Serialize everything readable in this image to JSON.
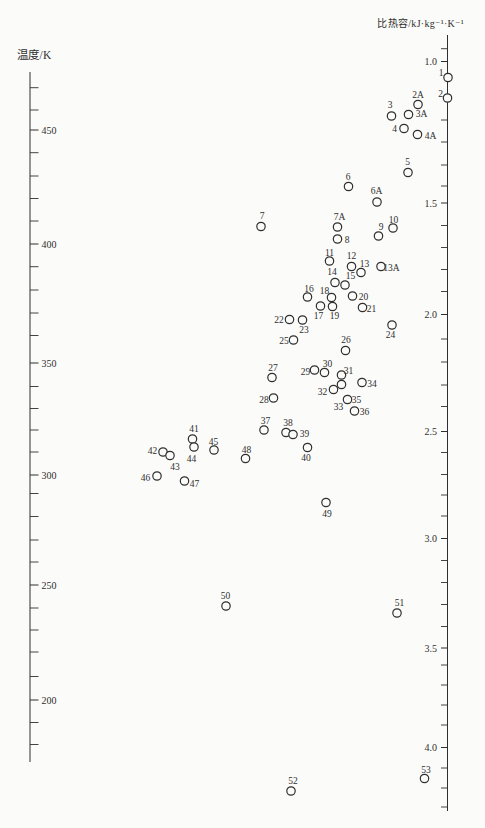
{
  "page": {
    "background": "#fbfbf9",
    "ink": "#2f2f2f"
  },
  "chart_data": {
    "type": "scatter",
    "title": "",
    "left_axis": {
      "title": "温度/K",
      "unit": "K",
      "range": [
        180,
        470
      ],
      "x_px": 30,
      "top_px": 72,
      "bottom_px": 762,
      "tick_len": 8.5,
      "majors": [
        {
          "value": "450",
          "y": 130
        },
        {
          "value": "400",
          "y": 244
        },
        {
          "value": "350",
          "y": 363
        },
        {
          "value": "300",
          "y": 475
        },
        {
          "value": "250",
          "y": 585
        },
        {
          "value": "200",
          "y": 700
        }
      ],
      "minor_y": [
        87.7,
        110,
        152.7,
        176,
        198.5,
        221,
        266.7,
        290,
        313,
        335.5,
        386.5,
        408.5,
        430,
        452,
        493.5,
        516.5,
        540,
        562,
        608,
        630,
        652,
        676.5,
        722.5,
        744.5
      ]
    },
    "right_axis": {
      "title": "比热容/kJ·kg⁻¹·K⁻¹",
      "unit": "kJ·kg⁻¹·K⁻¹",
      "range": [
        1.0,
        4.3
      ],
      "x_px": 447.5,
      "top_px": 35,
      "bottom_px": 811,
      "tick_len": 6.5,
      "majors": [
        {
          "value": "1.0",
          "y": 61.5
        },
        {
          "value": "1.5",
          "y": 203
        },
        {
          "value": "2.0",
          "y": 314.5
        },
        {
          "value": "2.5",
          "y": 431.5
        },
        {
          "value": "3.0",
          "y": 538.5
        },
        {
          "value": "3.5",
          "y": 648
        },
        {
          "value": "4.0",
          "y": 747.5
        }
      ],
      "minor_y": [
        48.7,
        120,
        142,
        165,
        186,
        225.5,
        247.5,
        269.5,
        291.5,
        339,
        362,
        385,
        406.5,
        452.5,
        474.5,
        495,
        516,
        560.5,
        582.5,
        604.5,
        626.5,
        665,
        685,
        705,
        725,
        768,
        788,
        807
      ]
    },
    "marker": {
      "radius": 4.2,
      "stroke_width": 1.2
    },
    "points": [
      {
        "label": "1",
        "cx": 448,
        "cy": 77.5,
        "lx": 441,
        "ly": 72.5
      },
      {
        "label": "2",
        "cx": 447.5,
        "cy": 98,
        "lx": 440.5,
        "ly": 93.5
      },
      {
        "label": "2A",
        "cx": 418,
        "cy": 104.5,
        "lx": 418,
        "ly": 95
      },
      {
        "label": "3",
        "cx": 391.5,
        "cy": 116,
        "lx": 390,
        "ly": 105
      },
      {
        "label": "3A",
        "cx": 408.5,
        "cy": 114.5,
        "lx": 421.5,
        "ly": 113.5
      },
      {
        "label": "4",
        "cx": 404,
        "cy": 128.5,
        "lx": 394.5,
        "ly": 128.5
      },
      {
        "label": "4A",
        "cx": 417.5,
        "cy": 134.5,
        "lx": 430.5,
        "ly": 136
      },
      {
        "label": "5",
        "cx": 408,
        "cy": 172.5,
        "lx": 407.5,
        "ly": 161.5
      },
      {
        "label": "6",
        "cx": 348.5,
        "cy": 186.5,
        "lx": 348,
        "ly": 176.5
      },
      {
        "label": "6A",
        "cx": 377,
        "cy": 202,
        "lx": 376.5,
        "ly": 191
      },
      {
        "label": "7",
        "cx": 261,
        "cy": 226.5,
        "lx": 262,
        "ly": 216
      },
      {
        "label": "7A",
        "cx": 337.5,
        "cy": 227,
        "lx": 339.5,
        "ly": 216.5
      },
      {
        "label": "8",
        "cx": 337.5,
        "cy": 239,
        "lx": 347,
        "ly": 239.5
      },
      {
        "label": "9",
        "cx": 378.5,
        "cy": 236,
        "lx": 381,
        "ly": 226.5
      },
      {
        "label": "10",
        "cx": 393,
        "cy": 228,
        "lx": 393.5,
        "ly": 219.5
      },
      {
        "label": "11",
        "cx": 329.5,
        "cy": 261,
        "lx": 329.5,
        "ly": 253
      },
      {
        "label": "12",
        "cx": 351.5,
        "cy": 266.5,
        "lx": 351.5,
        "ly": 256
      },
      {
        "label": "13",
        "cx": 361,
        "cy": 272.5,
        "lx": 364.5,
        "ly": 264
      },
      {
        "label": "13A",
        "cx": 381,
        "cy": 266.5,
        "lx": 391.5,
        "ly": 267.5
      },
      {
        "label": "14",
        "cx": 335,
        "cy": 282.5,
        "lx": 332,
        "ly": 272
      },
      {
        "label": "15",
        "cx": 345,
        "cy": 285,
        "lx": 350.5,
        "ly": 276
      },
      {
        "label": "16",
        "cx": 307.5,
        "cy": 297,
        "lx": 309,
        "ly": 288.5
      },
      {
        "label": "17",
        "cx": 320.5,
        "cy": 306,
        "lx": 318.5,
        "ly": 316
      },
      {
        "label": "18",
        "cx": 331.5,
        "cy": 297.5,
        "lx": 324.5,
        "ly": 290.5
      },
      {
        "label": "19",
        "cx": 332.5,
        "cy": 306.5,
        "lx": 334.5,
        "ly": 316
      },
      {
        "label": "20",
        "cx": 352.5,
        "cy": 296,
        "lx": 363.5,
        "ly": 296.5
      },
      {
        "label": "21",
        "cx": 362.5,
        "cy": 307.5,
        "lx": 371.5,
        "ly": 308.5
      },
      {
        "label": "22",
        "cx": 289.5,
        "cy": 319.5,
        "lx": 279,
        "ly": 319.5
      },
      {
        "label": "23",
        "cx": 302.5,
        "cy": 320,
        "lx": 304,
        "ly": 329.5
      },
      {
        "label": "24",
        "cx": 392,
        "cy": 325,
        "lx": 390.5,
        "ly": 335
      },
      {
        "label": "25",
        "cx": 293.5,
        "cy": 340,
        "lx": 284,
        "ly": 340.5
      },
      {
        "label": "26",
        "cx": 345.5,
        "cy": 350.5,
        "lx": 346,
        "ly": 340
      },
      {
        "label": "27",
        "cx": 272,
        "cy": 377.5,
        "lx": 273,
        "ly": 368
      },
      {
        "label": "28",
        "cx": 273.5,
        "cy": 398,
        "lx": 264,
        "ly": 399.5
      },
      {
        "label": "29",
        "cx": 314.5,
        "cy": 370,
        "lx": 305.5,
        "ly": 371.5
      },
      {
        "label": "30",
        "cx": 324.5,
        "cy": 372.5,
        "lx": 327.5,
        "ly": 363.5
      },
      {
        "label": "31",
        "cx": 341.5,
        "cy": 375,
        "lx": 348.5,
        "ly": 370.5
      },
      {
        "label": "32",
        "cx": 333.5,
        "cy": 389.5,
        "lx": 322.5,
        "ly": 392
      },
      {
        "label": "33",
        "cx": 341.5,
        "cy": 384.5,
        "lx": 338.5,
        "ly": 406.5
      },
      {
        "label": "34",
        "cx": 362,
        "cy": 382.5,
        "lx": 372,
        "ly": 383.5
      },
      {
        "label": "35",
        "cx": 347.5,
        "cy": 399.5,
        "lx": 356.5,
        "ly": 399.5
      },
      {
        "label": "36",
        "cx": 354.5,
        "cy": 411,
        "lx": 364.5,
        "ly": 411.5
      },
      {
        "label": "37",
        "cx": 264,
        "cy": 430,
        "lx": 265.5,
        "ly": 420.5
      },
      {
        "label": "38",
        "cx": 286,
        "cy": 432.5,
        "lx": 288,
        "ly": 422.5
      },
      {
        "label": "39",
        "cx": 293,
        "cy": 434.5,
        "lx": 304.5,
        "ly": 433.5
      },
      {
        "label": "40",
        "cx": 307.5,
        "cy": 447.5,
        "lx": 306,
        "ly": 457.5
      },
      {
        "label": "41",
        "cx": 192.5,
        "cy": 439,
        "lx": 194,
        "ly": 428.5
      },
      {
        "label": "42",
        "cx": 163,
        "cy": 452,
        "lx": 152.5,
        "ly": 450.5
      },
      {
        "label": "43",
        "cx": 170,
        "cy": 455.5,
        "lx": 175,
        "ly": 467
      },
      {
        "label": "44",
        "cx": 194,
        "cy": 447,
        "lx": 191.5,
        "ly": 458.5
      },
      {
        "label": "45",
        "cx": 214,
        "cy": 450,
        "lx": 213.5,
        "ly": 441.5
      },
      {
        "label": "46",
        "cx": 157,
        "cy": 476,
        "lx": 145.5,
        "ly": 477.5
      },
      {
        "label": "47",
        "cx": 184.5,
        "cy": 481,
        "lx": 194.5,
        "ly": 483.5
      },
      {
        "label": "48",
        "cx": 245.5,
        "cy": 458.5,
        "lx": 246.5,
        "ly": 449.5
      },
      {
        "label": "49",
        "cx": 326,
        "cy": 502.5,
        "lx": 327,
        "ly": 513.5
      },
      {
        "label": "50",
        "cx": 226,
        "cy": 606,
        "lx": 225.5,
        "ly": 595.5
      },
      {
        "label": "51",
        "cx": 397,
        "cy": 613,
        "lx": 399.5,
        "ly": 603
      },
      {
        "label": "52",
        "cx": 291,
        "cy": 791,
        "lx": 293,
        "ly": 780.5
      },
      {
        "label": "53",
        "cx": 424.5,
        "cy": 778.5,
        "lx": 426,
        "ly": 770
      }
    ]
  }
}
